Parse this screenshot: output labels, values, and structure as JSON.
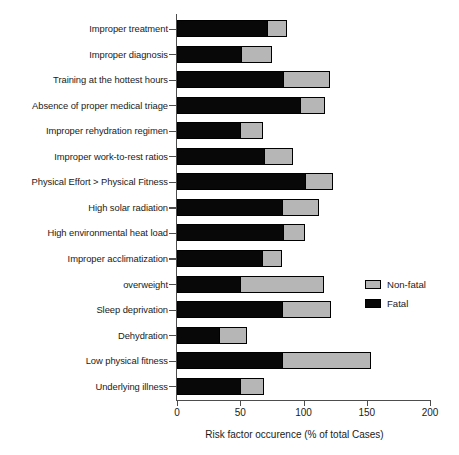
{
  "chart_data": {
    "type": "bar",
    "orientation": "horizontal",
    "stacked": true,
    "title": "",
    "xlabel": "Risk factor occurence (% of total Cases)",
    "ylabel": "",
    "xlim": [
      0,
      200
    ],
    "xticks": [
      0,
      50,
      100,
      150,
      200
    ],
    "xtick_labels": [
      "0",
      "50",
      "100",
      "150",
      "200"
    ],
    "grid": false,
    "legend_position": "right",
    "categories": [
      "Improper treatment",
      "Improper diagnosis",
      "Training at the hottest hours",
      "Absence of proper medical triage",
      "Improper rehydration regimen",
      "Improper work-to-rest ratios",
      "Physical Effort > Physical Fitness",
      "High solar radiation",
      "High environmental heat load",
      "Improper acclimatization",
      "overweight",
      "Sleep deprivation",
      "Dehydration",
      "Low physical fitness",
      "Underlying illness"
    ],
    "series": [
      {
        "name": "Fatal",
        "color": "#080808",
        "values": [
          72,
          52,
          85,
          98,
          51,
          70,
          102,
          84,
          85,
          68,
          51,
          84,
          34,
          84,
          51
        ]
      },
      {
        "name": "Non-fatal",
        "color": "#b6b6b6",
        "values": [
          15,
          23,
          36,
          19,
          17,
          22,
          21,
          28,
          16,
          15,
          65,
          38,
          21,
          69,
          18
        ]
      }
    ],
    "totals": [
      87,
      75,
      121,
      117,
      68,
      92,
      123,
      112,
      101,
      83,
      116,
      122,
      55,
      153,
      69
    ]
  },
  "legend": {
    "entries": [
      {
        "label": "Non-fatal",
        "swatch": "nonfatal"
      },
      {
        "label": "Fatal",
        "swatch": "fatal"
      }
    ]
  }
}
